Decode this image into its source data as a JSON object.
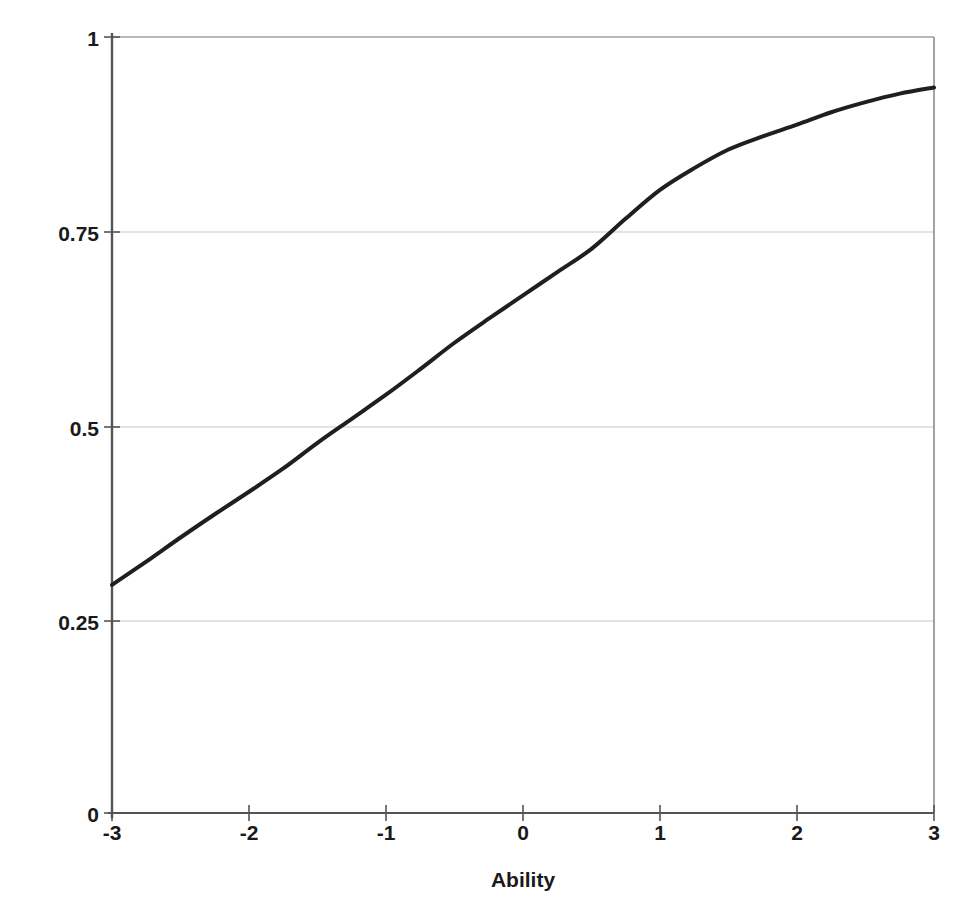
{
  "chart_data": {
    "type": "line",
    "title": "",
    "xlabel": "Ability",
    "ylabel": "Probability of correct response",
    "xlim": [
      -3,
      3
    ],
    "ylim": [
      0,
      1
    ],
    "grid": true,
    "gridlines": "horizontal",
    "legend": null,
    "x_ticks": [
      "-3",
      "-2",
      "-1",
      "0",
      "1",
      "2",
      "3"
    ],
    "x_tick_values": [
      -3,
      -2,
      -1,
      0,
      1,
      2,
      3
    ],
    "y_ticks": [
      "0",
      "0.25",
      "0.5",
      "0.75",
      "1"
    ],
    "y_tick_values": [
      0,
      0.25,
      0.5,
      0.75,
      1
    ],
    "series": [
      {
        "name": "Item characteristic curve",
        "color": "#1f1f1f",
        "line_width": 4,
        "x": [
          -3,
          -2.75,
          -2.5,
          -2.25,
          -2,
          -1.75,
          -1.5,
          -1.25,
          -1,
          -0.75,
          -0.5,
          -0.25,
          0,
          0.25,
          0.5,
          0.75,
          1,
          1.25,
          1.5,
          1.75,
          2,
          2.25,
          2.5,
          2.75,
          3
        ],
        "values": [
          0.294,
          0.324,
          0.355,
          0.385,
          0.414,
          0.444,
          0.477,
          0.508,
          0.539,
          0.572,
          0.606,
          0.637,
          0.667,
          0.697,
          0.727,
          0.766,
          0.803,
          0.831,
          0.855,
          0.872,
          0.887,
          0.903,
          0.916,
          0.927,
          0.935
        ]
      }
    ]
  },
  "axes": {
    "x_title": "Ability",
    "y_title": "Probability of correct response"
  }
}
